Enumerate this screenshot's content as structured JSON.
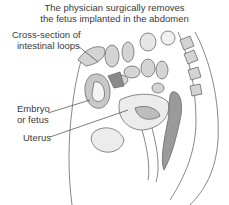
{
  "title": {
    "line1": "The physician surgically removes",
    "line2": "the fetus implanted in the abdomen"
  },
  "labels": {
    "intestinal_line1": "Cross-section of",
    "intestinal_line2": "intestinal loops",
    "embryo_line1": "Embryo",
    "embryo_line2": "or fetus",
    "uterus": "Uterus"
  },
  "colors": {
    "organ_fill": "#d0d0d0",
    "organ_dark": "#8a8a8a",
    "outline": "#6a6a6a",
    "background": "#ffffff"
  }
}
